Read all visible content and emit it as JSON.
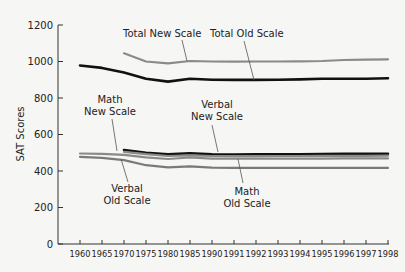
{
  "chart_data": {
    "type": "line",
    "title": "",
    "xlabel": "",
    "ylabel": "SAT Scores",
    "ylim": [
      0,
      1200
    ],
    "yticks": [
      0,
      200,
      400,
      600,
      800,
      1000,
      1200
    ],
    "grid": false,
    "legend": "inline annotations",
    "categories": [
      "1960",
      "1965",
      "1970",
      "1975",
      "1980",
      "1985",
      "1990",
      "1991",
      "1992",
      "1993",
      "1994",
      "1995",
      "1996",
      "1997",
      "1998"
    ],
    "series": [
      {
        "name": "Total Old Scale",
        "color": "#111111",
        "width": 2.6,
        "values": [
          978,
          965,
          940,
          905,
          890,
          905,
          900,
          899,
          899,
          900,
          902,
          905,
          905,
          905,
          908
        ]
      },
      {
        "name": "Total New Scale",
        "color": "#8a8a8a",
        "width": 2.2,
        "values": [
          null,
          null,
          1045,
          1000,
          990,
          1003,
          1000,
          999,
          1000,
          1000,
          1001,
          1003,
          1008,
          1010,
          1012
        ]
      },
      {
        "name": "Math New Scale",
        "color": "#111111",
        "width": 2.6,
        "values": [
          null,
          null,
          515,
          500,
          492,
          497,
          492,
          490,
          491,
          492,
          492,
          493,
          494,
          494,
          495
        ]
      },
      {
        "name": "Verbal New Scale",
        "color": "#8a8a8a",
        "width": 2.2,
        "values": [
          null,
          null,
          505,
          492,
          482,
          486,
          482,
          481,
          481,
          482,
          482,
          483,
          483,
          483,
          484
        ]
      },
      {
        "name": "Math Old Scale",
        "color": "#8a8a8a",
        "width": 2.2,
        "values": [
          496,
          494,
          488,
          475,
          466,
          474,
          468,
          468,
          468,
          468,
          468,
          468,
          469,
          469,
          469
        ]
      },
      {
        "name": "Verbal Old Scale",
        "color": "#7a7a7a",
        "width": 2.2,
        "values": [
          477,
          472,
          460,
          432,
          420,
          426,
          418,
          417,
          417,
          417,
          417,
          417,
          417,
          417,
          417
        ]
      }
    ],
    "annotations": [
      {
        "text": [
          "Total New Scale"
        ],
        "x": 123,
        "y": 37,
        "pointer": [
          [
            182,
            40
          ],
          [
            187,
            61
          ]
        ]
      },
      {
        "text": [
          "Total Old Scale"
        ],
        "x": 210,
        "y": 37,
        "pointer": [
          [
            244,
            41
          ],
          [
            254,
            80
          ]
        ]
      },
      {
        "text": [
          "Math",
          "New Scale"
        ],
        "x": 110,
        "y": 103,
        "pointer": [
          [
            112,
            119
          ],
          [
            117,
            151
          ]
        ]
      },
      {
        "text": [
          "Verbal",
          "New Scale"
        ],
        "x": 217,
        "y": 108,
        "pointer": [
          [
            212,
            125
          ],
          [
            218,
            152
          ]
        ]
      },
      {
        "text": [
          "Verbal",
          "Old Scale"
        ],
        "x": 127,
        "y": 192,
        "pointer": [
          [
            128,
            182
          ],
          [
            121,
            159
          ]
        ]
      },
      {
        "text": [
          "Math",
          "Old Scale"
        ],
        "x": 247,
        "y": 195,
        "pointer": [
          [
            243,
            183
          ],
          [
            238,
            159
          ]
        ]
      }
    ]
  }
}
